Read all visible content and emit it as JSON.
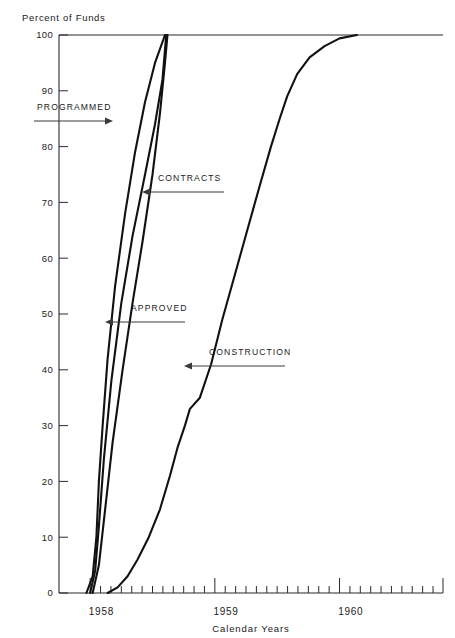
{
  "chart_data": {
    "type": "line",
    "title": "",
    "ylabel": "Percent of Funds",
    "xlabel": "Calendar Years",
    "ylim": [
      0,
      100
    ],
    "xlim": [
      1957.75,
      1960.83
    ],
    "ytick_labels": [
      "0",
      "10",
      "20",
      "30",
      "40",
      "50",
      "60",
      "70",
      "80",
      "90",
      "100"
    ],
    "ytick_values": [
      0,
      10,
      20,
      30,
      40,
      50,
      60,
      70,
      80,
      90,
      100
    ],
    "xtick_labels": [
      "1958",
      "1959",
      "1960"
    ],
    "xtick_values": [
      1958,
      1959,
      1960
    ],
    "x_minor_interval_months": 1,
    "grid": false,
    "legend_position": "inline-annotations",
    "series": [
      {
        "name": "PROGRAMMED",
        "points": [
          [
            1957.97,
            0
          ],
          [
            1958.02,
            3
          ],
          [
            1958.05,
            10
          ],
          [
            1958.07,
            20
          ],
          [
            1958.1,
            30
          ],
          [
            1958.14,
            42
          ],
          [
            1958.2,
            55
          ],
          [
            1958.28,
            68
          ],
          [
            1958.36,
            79
          ],
          [
            1958.44,
            88
          ],
          [
            1958.52,
            95
          ],
          [
            1958.6,
            100
          ]
        ]
      },
      {
        "name": "APPROVED",
        "points": [
          [
            1958.0,
            0
          ],
          [
            1958.04,
            4
          ],
          [
            1958.07,
            12
          ],
          [
            1958.11,
            24
          ],
          [
            1958.17,
            38
          ],
          [
            1958.25,
            52
          ],
          [
            1958.34,
            64
          ],
          [
            1958.44,
            75
          ],
          [
            1958.52,
            84
          ],
          [
            1958.58,
            92
          ],
          [
            1958.61,
            100
          ]
        ]
      },
      {
        "name": "CONTRACTS",
        "points": [
          [
            1958.02,
            0
          ],
          [
            1958.07,
            5
          ],
          [
            1958.12,
            15
          ],
          [
            1958.18,
            27
          ],
          [
            1958.26,
            40
          ],
          [
            1958.34,
            52
          ],
          [
            1958.42,
            63
          ],
          [
            1958.5,
            75
          ],
          [
            1958.56,
            86
          ],
          [
            1958.6,
            95
          ],
          [
            1958.62,
            100
          ]
        ]
      },
      {
        "name": "CONSTRUCTION",
        "points": [
          [
            1958.14,
            0
          ],
          [
            1958.22,
            1
          ],
          [
            1958.3,
            3
          ],
          [
            1958.38,
            6
          ],
          [
            1958.47,
            10
          ],
          [
            1958.56,
            15
          ],
          [
            1958.64,
            21
          ],
          [
            1958.7,
            26
          ],
          [
            1958.76,
            30
          ],
          [
            1958.8,
            33
          ],
          [
            1958.88,
            35
          ],
          [
            1958.97,
            41
          ],
          [
            1959.06,
            49
          ],
          [
            1959.16,
            57
          ],
          [
            1959.26,
            65
          ],
          [
            1959.36,
            73
          ],
          [
            1959.45,
            80
          ],
          [
            1959.52,
            85
          ],
          [
            1959.58,
            89
          ],
          [
            1959.66,
            93
          ],
          [
            1959.76,
            96
          ],
          [
            1959.88,
            98
          ],
          [
            1960.0,
            99.4
          ],
          [
            1960.14,
            100
          ]
        ]
      }
    ],
    "annotations": [
      {
        "label": "PROGRAMMED",
        "arrow_direction": "right",
        "target_series": "PROGRAMMED"
      },
      {
        "label": "CONTRACTS",
        "arrow_direction": "left",
        "target_series": "CONTRACTS"
      },
      {
        "label": "APPROVED",
        "arrow_direction": "left",
        "target_series": "APPROVED"
      },
      {
        "label": "CONSTRUCTION",
        "arrow_direction": "left",
        "target_series": "CONSTRUCTION"
      }
    ],
    "colors": {
      "series_line": "#111111",
      "axis": "#2b2b2b",
      "annotation": "#3a3a3a",
      "background": "#ffffff"
    }
  }
}
